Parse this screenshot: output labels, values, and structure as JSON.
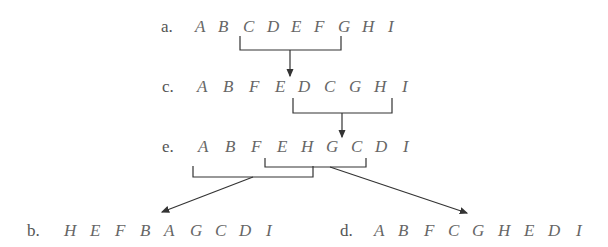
{
  "rows": {
    "a": {
      "label": "a.",
      "letters": [
        "A",
        "B",
        "C",
        "D",
        "E",
        "F",
        "G",
        "H",
        "I"
      ]
    },
    "c": {
      "label": "c.",
      "letters": [
        "A",
        "B",
        "F",
        "E",
        "D",
        "C",
        "G",
        "H",
        "I"
      ]
    },
    "e": {
      "label": "e.",
      "letters": [
        "A",
        "B",
        "F",
        "E",
        "H",
        "G",
        "C",
        "D",
        "I"
      ]
    },
    "b": {
      "label": "b.",
      "letters": [
        "H",
        "E",
        "F",
        "B",
        "A",
        "G",
        "C",
        "D",
        "I"
      ]
    },
    "d": {
      "label": "d.",
      "letters": [
        "A",
        "B",
        "F",
        "C",
        "G",
        "H",
        "E",
        "D",
        "I"
      ]
    }
  },
  "colors": {
    "text": "#666666",
    "lines": "#333333"
  }
}
